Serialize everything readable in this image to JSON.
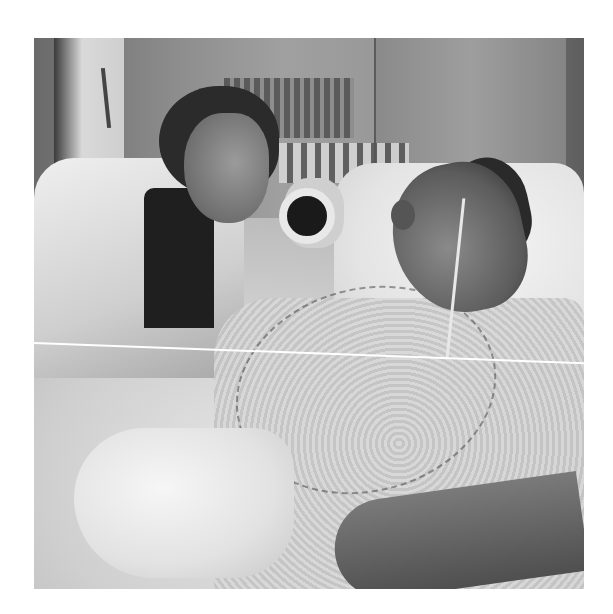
{
  "image": {
    "description": "Black-and-white photograph of a hospital room: a woman in a white coat holding a microphone to a man lying in a hospital bed wearing a nasal cannula and hospital gown",
    "style": "grayscale photo",
    "artifacts": [
      "thin white diagonal scan line across the middle"
    ]
  }
}
